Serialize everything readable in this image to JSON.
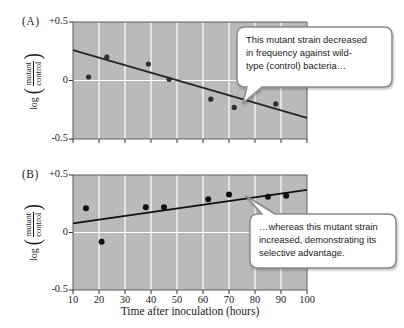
{
  "figure": {
    "panels": [
      {
        "id": "A",
        "label": "(A)"
      },
      {
        "id": "B",
        "label": "(B)"
      }
    ],
    "y_axis_label": {
      "prefix": "log",
      "numerator": "mutant",
      "denominator": "control"
    },
    "x_axis_label": "Time after inoculation (hours)",
    "colors": {
      "plot_bg": "#bababa",
      "gridline": "#ffffff",
      "axis": "#5f5f5f",
      "tick": "#333333",
      "callout_border": "#8a8a8a",
      "callout_bg": "#ffffff"
    }
  },
  "callouts": {
    "a": {
      "lines": [
        "This mutant strain decreased",
        "in frequency against wild-",
        "type (control) bacteria…"
      ]
    },
    "b": {
      "lines": [
        "…whereas this mutant strain",
        "increased, demonstrating its",
        "selective advantage."
      ]
    }
  },
  "chart_data": [
    {
      "type": "scatter",
      "panel": "A",
      "description": "Mutant strain decreasing in frequency vs wild-type control",
      "x": [
        16,
        23,
        39,
        47,
        63,
        72,
        88
      ],
      "y": [
        0.03,
        0.2,
        0.14,
        0.01,
        -0.16,
        -0.23,
        -0.2
      ],
      "trend_line": {
        "x": [
          10,
          100
        ],
        "y": [
          0.26,
          -0.32
        ]
      },
      "xlim": [
        10,
        100
      ],
      "ylim": [
        -0.5,
        0.5
      ],
      "x_gridlines": [
        20,
        30,
        40,
        50,
        60,
        70,
        80,
        90
      ],
      "y_gridlines": [
        0
      ],
      "x_tick_positions": [
        10,
        20,
        30,
        40,
        50,
        60,
        70,
        80,
        90,
        100
      ],
      "x_tick_labels": [],
      "y_ticks": [
        {
          "v": 0.5,
          "label": "+0.5"
        },
        {
          "v": 0,
          "label": "0"
        },
        {
          "v": -0.5,
          "label": "-0.5"
        }
      ],
      "point_color": "#2e2e2e",
      "point_radius": 2.6,
      "line_color": "#242424",
      "bg": "#bababa",
      "grid_color": "#ffffff"
    },
    {
      "type": "scatter",
      "panel": "B",
      "description": "Mutant strain increasing in frequency, selective advantage",
      "x": [
        15,
        21,
        38,
        45,
        62,
        70,
        85,
        92
      ],
      "y": [
        0.21,
        -0.08,
        0.22,
        0.22,
        0.29,
        0.33,
        0.31,
        0.32
      ],
      "trend_line": {
        "x": [
          10,
          100
        ],
        "y": [
          0.08,
          0.37
        ]
      },
      "xlim": [
        10,
        100
      ],
      "ylim": [
        -0.5,
        0.5
      ],
      "x_gridlines": [
        20,
        30,
        40,
        50,
        60,
        70,
        80,
        90
      ],
      "y_gridlines": [
        0
      ],
      "x_tick_positions": [
        10,
        20,
        30,
        40,
        50,
        60,
        70,
        80,
        90,
        100
      ],
      "x_tick_labels": [
        "10",
        "20",
        "30",
        "40",
        "50",
        "60",
        "70",
        "80",
        "90",
        "100"
      ],
      "y_ticks": [
        {
          "v": 0.5,
          "label": "+0.5"
        },
        {
          "v": 0,
          "label": "0"
        },
        {
          "v": -0.5,
          "label": "-0.5"
        }
      ],
      "point_color": "#101010",
      "point_radius": 3,
      "line_color": "#111111",
      "bg": "#bababa",
      "grid_color": "#ffffff"
    }
  ]
}
